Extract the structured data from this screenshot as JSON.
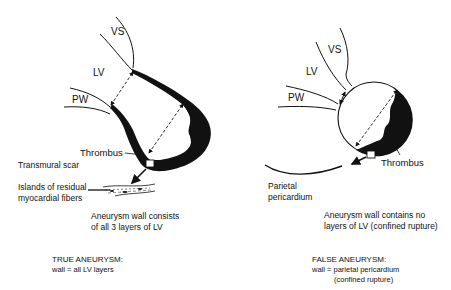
{
  "true_aneurysm": {
    "labels": {
      "vs": "VS",
      "lv": "LV",
      "pw": "PW",
      "thrombus": "Thrombus",
      "transmural_scar": "Transmural scar",
      "islands_line1": "Islands of residual",
      "islands_line2": "myocardial fibers"
    },
    "description": [
      "Aneurysm wall consists",
      "of all 3 layers of LV"
    ],
    "caption_title": "TRUE ANEURYSM:",
    "caption_body": "wall = all LV layers"
  },
  "false_aneurysm": {
    "labels": {
      "vs": "VS",
      "lv": "LV",
      "pw": "PW",
      "thrombus": "Thrombus",
      "parietal_line1": "Parietal",
      "parietal_line2": "pericardium"
    },
    "description": [
      "Aneurysm wall contains no",
      "layers of LV (confined rupture)"
    ],
    "caption_title": "FALSE ANEURYSM:",
    "caption_body": "wall = parietal pericardium",
    "caption_body2": "(confined rupture)"
  },
  "colors": {
    "ink": "#111111",
    "background": "#ffffff"
  }
}
